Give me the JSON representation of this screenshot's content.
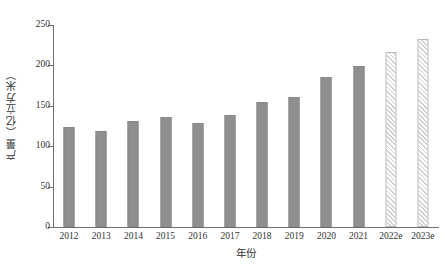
{
  "chart_data": {
    "type": "bar",
    "title": "",
    "xlabel": "年份",
    "ylabel": "产量（亿立方米）",
    "categories": [
      "2012",
      "2013",
      "2014",
      "2015",
      "2016",
      "2017",
      "2018",
      "2019",
      "2020",
      "2021",
      "2022e",
      "2023e"
    ],
    "values": [
      124,
      119,
      131,
      136,
      129,
      139,
      155,
      161,
      186,
      199,
      216,
      233
    ],
    "series": [
      {
        "name": "产量（亿立方米）",
        "values": [
          124,
          119,
          131,
          136,
          129,
          139,
          155,
          161,
          186,
          199,
          216,
          233
        ],
        "styles": [
          "solid",
          "solid",
          "solid",
          "solid",
          "solid",
          "solid",
          "solid",
          "solid",
          "solid",
          "solid",
          "hatched",
          "hatched"
        ]
      }
    ],
    "ylim": [
      0,
      250
    ],
    "yticks": [
      0,
      50,
      100,
      150,
      200,
      250
    ],
    "ytick_labels": [
      "0",
      "50",
      "100",
      "150",
      "200",
      "250"
    ],
    "grid": false,
    "legend": "none",
    "colors": {
      "bar_solid": "#8f8f8f",
      "bar_solid_border": "#878787",
      "bar_hatch_border": "#b9b9b9",
      "bar_hatch_line": "#cfcfcf",
      "axis": "#6f6f6f",
      "text": "#333333",
      "background": "#ffffff"
    }
  }
}
